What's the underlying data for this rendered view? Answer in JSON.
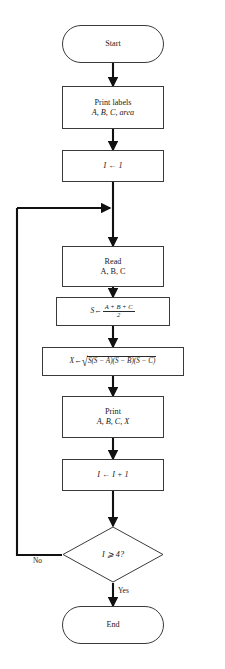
{
  "diagram": {
    "type": "flowchart",
    "nodes": [
      {
        "id": "start",
        "shape": "terminal",
        "text": "Start"
      },
      {
        "id": "print_labels",
        "shape": "process",
        "line1": "Print labels",
        "line2": "A, B, C, area"
      },
      {
        "id": "init",
        "shape": "process",
        "text": "I ← 1"
      },
      {
        "id": "read",
        "shape": "process",
        "line1": "Read",
        "line2": "A, B, C"
      },
      {
        "id": "semi",
        "shape": "process",
        "text": "S ← (A + B + C) / 2",
        "lhs": "S",
        "arrow": "←",
        "numerator": "A + B + C",
        "denominator": "2"
      },
      {
        "id": "area",
        "shape": "process",
        "text": "X ← √S(S − A)(S − B)(S − C)",
        "lhs": "X",
        "arrow": "←",
        "radical": "√",
        "radicand": "S(S − A)(S − B)(S − C)"
      },
      {
        "id": "print_vals",
        "shape": "process",
        "line1": "Print",
        "line2": "A, B, C, X"
      },
      {
        "id": "incr",
        "shape": "process",
        "text": "I ← I + 1"
      },
      {
        "id": "decide",
        "shape": "decision",
        "text": "I ⩾ 4?"
      },
      {
        "id": "end",
        "shape": "terminal",
        "text": "End"
      }
    ],
    "edge_labels": {
      "no": "No",
      "yes": "Yes"
    },
    "colors": {
      "stroke": "#3a3a3a",
      "arrow": "#111111",
      "background": "#ffffff",
      "text": "#1a1a1a"
    }
  }
}
